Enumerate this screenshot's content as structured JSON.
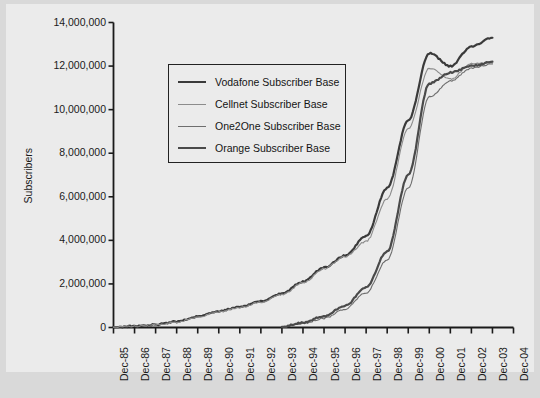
{
  "chart_data": {
    "type": "line",
    "title": "",
    "xlabel": "",
    "ylabel": "Subscribers",
    "ylim": [
      0,
      14000000
    ],
    "ytick_labels": [
      "0",
      "2,000,000",
      "4,000,000",
      "6,000,000",
      "8,000,000",
      "10,000,000",
      "12,000,000",
      "14,000,000"
    ],
    "ytick_values": [
      0,
      2000000,
      4000000,
      6000000,
      8000000,
      10000000,
      12000000,
      14000000
    ],
    "categories": [
      "Dec-85",
      "Dec-86",
      "Dec-87",
      "Dec-88",
      "Dec-89",
      "Dec-90",
      "Dec-91",
      "Dec-92",
      "Dec-93",
      "Dec-94",
      "Dec-95",
      "Dec-96",
      "Dec-97",
      "Dec-98",
      "Dec-99",
      "Dec-00",
      "Dec-01",
      "Dec-02",
      "Dec-03",
      "Dec-04"
    ],
    "grid": false,
    "legend_position": "upper-left-inside",
    "series": [
      {
        "name": "Vodafone Subscriber Base",
        "color": "#3a3a3a",
        "width": 2.2,
        "x": [
          "Dec-85",
          "Dec-86",
          "Dec-87",
          "Dec-88",
          "Dec-89",
          "Dec-90",
          "Dec-91",
          "Dec-92",
          "Dec-93",
          "Dec-94",
          "Dec-95",
          "Dec-96",
          "Dec-97",
          "Dec-98",
          "Dec-99",
          "Dec-00",
          "Dec-01",
          "Dec-02",
          "Dec-03"
        ],
        "values": [
          20000,
          60000,
          130000,
          270000,
          500000,
          750000,
          950000,
          1200000,
          1550000,
          2100000,
          2750000,
          3300000,
          4200000,
          6400000,
          9500000,
          12600000,
          12000000,
          12900000,
          13300000
        ]
      },
      {
        "name": "Cellnet Subscriber Base",
        "color": "#8c8c8c",
        "width": 1.1,
        "x": [
          "Dec-85",
          "Dec-86",
          "Dec-87",
          "Dec-88",
          "Dec-89",
          "Dec-90",
          "Dec-91",
          "Dec-92",
          "Dec-93",
          "Dec-94",
          "Dec-95",
          "Dec-96",
          "Dec-97",
          "Dec-98",
          "Dec-99",
          "Dec-00",
          "Dec-01",
          "Dec-02",
          "Dec-03"
        ],
        "values": [
          15000,
          55000,
          120000,
          250000,
          480000,
          730000,
          920000,
          1170000,
          1500000,
          2050000,
          2700000,
          3250000,
          3950000,
          5900000,
          9100000,
          11900000,
          11400000,
          12100000,
          12150000
        ]
      },
      {
        "name": "One2One Subscriber Base",
        "color": "#6e6e6e",
        "width": 1.1,
        "x": [
          "Dec-93",
          "Dec-94",
          "Dec-95",
          "Dec-96",
          "Dec-97",
          "Dec-98",
          "Dec-99",
          "Dec-00",
          "Dec-01",
          "Dec-02",
          "Dec-03"
        ],
        "values": [
          40000,
          180000,
          420000,
          850000,
          1600000,
          3100000,
          6400000,
          10600000,
          11300000,
          11900000,
          12100000
        ]
      },
      {
        "name": "Orange Subscriber Base",
        "color": "#4a4a4a",
        "width": 2.2,
        "x": [
          "Dec-93",
          "Dec-94",
          "Dec-95",
          "Dec-96",
          "Dec-97",
          "Dec-98",
          "Dec-99",
          "Dec-00",
          "Dec-01",
          "Dec-02",
          "Dec-03"
        ],
        "values": [
          30000,
          220000,
          520000,
          1000000,
          1850000,
          3500000,
          7000000,
          11200000,
          11700000,
          12000000,
          12200000
        ]
      }
    ]
  },
  "legend": {
    "items": [
      {
        "label": "Vodafone Subscriber Base"
      },
      {
        "label": "Cellnet Subscriber Base"
      },
      {
        "label": "One2One Subscriber Base"
      },
      {
        "label": "Orange Subscriber Base"
      }
    ]
  }
}
